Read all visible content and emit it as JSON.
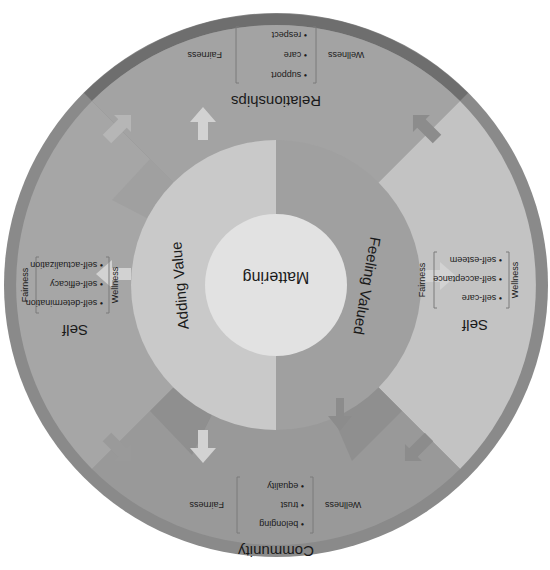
{
  "orientation": "rotated-180",
  "colors": {
    "background": "#ffffff",
    "outer_rim": "#8a8a8a",
    "outer_rim_dark": "#6e6e6e",
    "quadrant_relationships": "#a3a3a3",
    "quadrant_self_right": "#c3c3c3",
    "quadrant_community": "#999999",
    "quadrant_self_left": "#a6a6a6",
    "wedge_dark": "#8f8f8f",
    "adding_value": "#c9c9c9",
    "feeling_valued": "#a0a0a0",
    "center": "#e2e2e2",
    "arrow_light": "#d2d2d2",
    "arrow_dark": "#8c8c8c",
    "text": "#1a1a1a",
    "bracket": "#7a7a7a"
  },
  "center": {
    "label": "Mattering"
  },
  "inner_ring": {
    "left_label": "Adding Value",
    "right_label": "Feeling Valued"
  },
  "quadrants": [
    {
      "id": "relationships",
      "title": "Relationships",
      "wellness_label": "Wellness",
      "fairness_label": "Fairness",
      "items": [
        "support",
        "care",
        "respect"
      ]
    },
    {
      "id": "self-right",
      "title": "Self",
      "wellness_label": "Wellness",
      "fairness_label": "Fairness",
      "items": [
        "self-care",
        "self-acceptance",
        "self-esteem"
      ]
    },
    {
      "id": "community",
      "title": "Community",
      "wellness_label": "Wellness",
      "fairness_label": "Fairness",
      "items": [
        "belonging",
        "trust",
        "equality"
      ]
    },
    {
      "id": "self-left",
      "title": "Self",
      "wellness_label": "Wellness",
      "fairness_label": "Fairness",
      "items": [
        "self-determination",
        "self-efficacy",
        "self-actualization"
      ]
    }
  ],
  "bullet": "•"
}
